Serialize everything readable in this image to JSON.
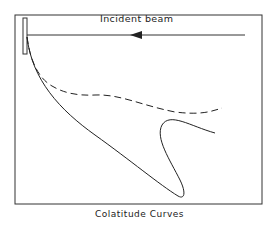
{
  "diagram": {
    "beam_label": "Incident beam",
    "caption": "Colatitude Curves",
    "elements": {
      "frame": "rectangle border",
      "target": "narrow vertical rectangle at upper-left",
      "beam": "horizontal line with left-pointing arrowhead",
      "solid_curve": "curve descending from target, looping back up to the right",
      "dashed_curve": "dashed curve descending from target then undulating right"
    },
    "colors": {
      "ink": "#222222",
      "background": "#ffffff"
    }
  }
}
